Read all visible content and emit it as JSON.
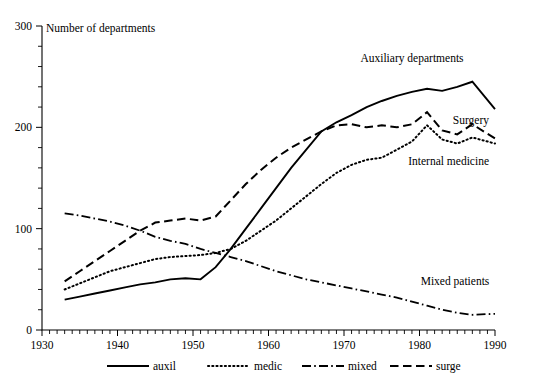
{
  "chart_data": {
    "type": "line",
    "title": "",
    "ylabel": "Number of departments",
    "xlabel": "",
    "xlim": [
      1930,
      1990
    ],
    "ylim": [
      0,
      300
    ],
    "y_ticks": [
      0,
      100,
      200,
      300
    ],
    "y_tick_labels": [
      "0",
      "100",
      "200",
      "300"
    ],
    "y_minor_step": 20,
    "x_ticks": [
      1930,
      1940,
      1950,
      1960,
      1970,
      1980,
      1990
    ],
    "x_tick_labels": [
      "1930",
      "1940",
      "1950",
      "1960",
      "1970",
      "1980",
      "1990"
    ],
    "x_minor_step": 1,
    "grid": false,
    "legend_position": "below-axes",
    "x": [
      1933,
      1935,
      1937,
      1939,
      1941,
      1943,
      1945,
      1947,
      1949,
      1951,
      1953,
      1955,
      1957,
      1959,
      1961,
      1963,
      1965,
      1967,
      1969,
      1971,
      1973,
      1975,
      1977,
      1979,
      1981,
      1983,
      1985,
      1987,
      1990
    ],
    "series": [
      {
        "name": "auxil",
        "legend_label": "auxil",
        "annotation": "Auxiliary departments",
        "style": "solid",
        "values": [
          30,
          33,
          36,
          39,
          42,
          45,
          47,
          50,
          51,
          50,
          62,
          80,
          100,
          120,
          140,
          160,
          178,
          196,
          205,
          212,
          220,
          226,
          231,
          235,
          238,
          236,
          240,
          245,
          218
        ]
      },
      {
        "name": "medic",
        "legend_label": "medic",
        "annotation": "Internal medicine",
        "style": "dotted",
        "values": [
          40,
          46,
          52,
          58,
          62,
          66,
          70,
          72,
          73,
          74,
          76,
          80,
          88,
          98,
          108,
          120,
          132,
          144,
          155,
          163,
          168,
          170,
          178,
          186,
          202,
          188,
          184,
          190,
          184
        ]
      },
      {
        "name": "mixed",
        "legend_label": "mixed",
        "annotation": "Mixed patients",
        "style": "dash-dot",
        "values": [
          115,
          113,
          110,
          107,
          103,
          98,
          92,
          88,
          85,
          80,
          76,
          72,
          68,
          63,
          58,
          54,
          50,
          47,
          44,
          41,
          38,
          35,
          32,
          28,
          24,
          20,
          17,
          15,
          16
        ]
      },
      {
        "name": "surge",
        "legend_label": "surge",
        "annotation": "Surgery",
        "style": "dashed",
        "values": [
          48,
          58,
          68,
          78,
          88,
          98,
          106,
          108,
          110,
          108,
          112,
          128,
          144,
          158,
          170,
          180,
          188,
          196,
          202,
          203,
          200,
          202,
          200,
          203,
          215,
          197,
          193,
          203,
          189
        ]
      }
    ],
    "annotations": [
      {
        "text": "Auxiliary departments",
        "series": "auxil"
      },
      {
        "text": "Surgery",
        "series": "surge"
      },
      {
        "text": "Internal medicine",
        "series": "medic"
      },
      {
        "text": "Mixed patients",
        "series": "mixed"
      }
    ],
    "legend": [
      {
        "label": "auxil",
        "style": "solid"
      },
      {
        "label": "medic",
        "style": "dotted"
      },
      {
        "label": "mixed",
        "style": "dash-dot"
      },
      {
        "label": "surge",
        "style": "dashed"
      }
    ]
  }
}
